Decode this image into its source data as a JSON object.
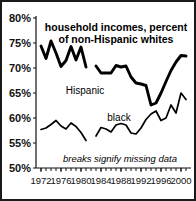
{
  "chart_data": {
    "type": "line",
    "title_line1": "household incomes, percent",
    "title_line2": "of non-Hispanic whites",
    "xlabel": "",
    "ylabel": "",
    "note": "breaks signify missing data",
    "grid": false,
    "legend_position": "inline-annotation",
    "xlim": [
      1971,
      2002
    ],
    "ylim": [
      50,
      80
    ],
    "ytick_labels": [
      "80%",
      "75%",
      "70%",
      "65%",
      "60%",
      "55%",
      "50%"
    ],
    "ytick_values": [
      80,
      75,
      70,
      65,
      60,
      55,
      50
    ],
    "xtick_labels": [
      "1972",
      "1976",
      "1980",
      "1984",
      "1988",
      "1992",
      "1996",
      "2000"
    ],
    "xtick_values": [
      1972,
      1976,
      1980,
      1984,
      1988,
      1992,
      1996,
      2000
    ],
    "xminor_step": 1,
    "series": [
      {
        "name": "Hispanic",
        "label": "Hispanic",
        "color": "#000000",
        "segments": [
          {
            "x": [
              1972,
              1973,
              1974,
              1975,
              1976,
              1977,
              1978,
              1979,
              1980,
              1981
            ],
            "y": [
              74.4,
              71.9,
              75.4,
              73.0,
              70.3,
              71.5,
              74.3,
              71.6,
              74.2,
              70.2
            ]
          },
          {
            "x": [
              1983,
              1984,
              1985,
              1986,
              1987,
              1988,
              1989,
              1990,
              1991,
              1992,
              1993,
              1994,
              1995,
              1996,
              1997,
              1998,
              1999,
              2000,
              2001
            ],
            "y": [
              70.4,
              69.0,
              69.0,
              69.0,
              70.5,
              70.2,
              70.4,
              68.2,
              67.0,
              66.8,
              66.5,
              62.6,
              63.0,
              65.0,
              67.3,
              69.5,
              71.2,
              72.5,
              72.4
            ]
          }
        ]
      },
      {
        "name": "black",
        "label": "black",
        "color": "#000000",
        "segments": [
          {
            "x": [
              1972,
              1973,
              1974,
              1975,
              1976,
              1977,
              1978,
              1979,
              1980,
              1981
            ],
            "y": [
              57.7,
              58.0,
              58.7,
              59.5,
              58.4,
              57.8,
              59.0,
              58.3,
              57.1,
              55.5
            ]
          },
          {
            "x": [
              1983,
              1984,
              1985,
              1986,
              1987,
              1988,
              1989,
              1990,
              1991,
              1992,
              1993,
              1994,
              1995,
              1996,
              1997,
              1998,
              1999,
              2000,
              2001
            ],
            "y": [
              56.4,
              58.1,
              57.8,
              57.2,
              58.6,
              58.9,
              58.6,
              57.0,
              56.8,
              58.0,
              59.7,
              60.8,
              61.4,
              59.5,
              60.0,
              62.6,
              61.0,
              65.0,
              63.7
            ]
          }
        ]
      }
    ]
  },
  "annotations": {
    "hispanic_label": "Hispanic",
    "black_label": "black"
  }
}
